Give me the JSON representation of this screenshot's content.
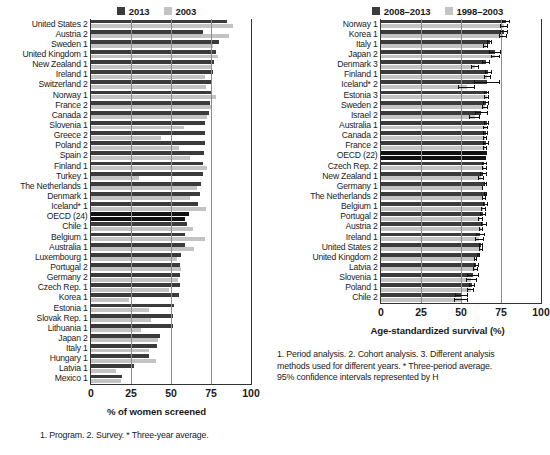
{
  "figure": {
    "panels": [
      {
        "id": "left",
        "legend": [
          {
            "label": "2013",
            "color": "#3b3b3b"
          },
          {
            "label": "2003",
            "color": "#c3c3c3"
          }
        ],
        "axis_title": "% of women screened",
        "ticks": [
          "0",
          "25",
          "50",
          "75",
          "100"
        ],
        "footnote": "1. Program. 2. Survey. * Three-year average."
      },
      {
        "id": "right",
        "legend": [
          {
            "label": "2008–2013",
            "color": "#3b3b3b"
          },
          {
            "label": "1998–2003",
            "color": "#c3c3c3"
          }
        ],
        "axis_title": "Age-standardized survival (%)",
        "ticks": [
          "0",
          "25",
          "50",
          "75",
          "100"
        ],
        "footnote": "1. Period analysis. 2. Cohort analysis. 3. Different analysis\nmethods used for different years. * Three-period average.\n95% confidence intervals represented by H"
      }
    ]
  },
  "chart_data": [
    {
      "type": "bar",
      "id": "cervical-screening",
      "title": "",
      "orientation": "horizontal",
      "xlabel": "% of women screened",
      "ylabel": "",
      "xlim": [
        0,
        100
      ],
      "xticks": [
        0,
        25,
        50,
        75,
        100
      ],
      "grid": true,
      "legend_position": "top",
      "categories": [
        "United States 2",
        "Austria 2",
        "Sweden 1",
        "United Kingdom 1",
        "New Zealand 1",
        "Ireland 1",
        "Switzerland 2",
        "Norway 1",
        "France 2",
        "Canada 2",
        "Slovenia 1",
        "Greece 2",
        "Poland 2",
        "Spain 2",
        "Finland 1",
        "Turkey 1",
        "The Netherlands 1",
        "Denmark 1",
        "Iceland* 1",
        "OECD (24)",
        "Chile 1",
        "Belgium 1",
        "Australia 1",
        "Luxembourg 1",
        "Portugal 2",
        "Germany 2",
        "Czech Rep. 1",
        "Korea 1",
        "Estonia 1",
        "Slovak Rep. 1",
        "Lithuania 1",
        "Japan 2",
        "Italy 1",
        "Hungary 1",
        "Latvia 1",
        "Mexico 1"
      ],
      "series": [
        {
          "name": "2013",
          "color": "#3b3b3b",
          "values": [
            85.0,
            70.0,
            80.0,
            78.0,
            77.0,
            76.0,
            75.0,
            75.0,
            74.5,
            74.0,
            71.5,
            71.0,
            71.0,
            70.5,
            70.0,
            70.0,
            68.5,
            68.0,
            67.0,
            61.5,
            60.0,
            59.0,
            58.5,
            56.0,
            55.5,
            55.5,
            55.5,
            55.0,
            52.0,
            51.5,
            51.0,
            43.0,
            41.0,
            36.0,
            27.0,
            19.5
          ]
        },
        {
          "name": "2003",
          "color": "#c3c3c3",
          "values": [
            88.5,
            86.0,
            76.0,
            79.5,
            75.5,
            71.5,
            72.0,
            78.0,
            75.5,
            72.5,
            58.0,
            44.0,
            55.0,
            62.0,
            72.5,
            30.0,
            66.0,
            62.0,
            72.0,
            59.0,
            63.5,
            71.0,
            64.5,
            54.0,
            56.5,
            54.5,
            49.0,
            23.5,
            36.5,
            37.5,
            31.0,
            42.0,
            36.5,
            40.5,
            15.5,
            19.0
          ]
        }
      ]
    },
    {
      "type": "bar",
      "id": "cervical-cancer-survival",
      "title": "",
      "orientation": "horizontal",
      "xlabel": "Age-standardized survival (%)",
      "ylabel": "",
      "xlim": [
        0,
        100
      ],
      "xticks": [
        0,
        25,
        50,
        75,
        100
      ],
      "grid": true,
      "legend_position": "top",
      "error_bars": "95% confidence intervals",
      "categories": [
        "Norway 1",
        "Korea 1",
        "Italy 1",
        "Japan 2",
        "Denmark 3",
        "Finland 1",
        "Iceland* 2",
        "Estonia 3",
        "Sweden 2",
        "Israel 2",
        "Australia 1",
        "Canada 2",
        "France 2",
        "OECD (22)",
        "Czech Rep. 2",
        "New Zealand 1",
        "Germany 1",
        "The Netherlands 2",
        "Belgium 1",
        "Portugal 2",
        "Austria 2",
        "Ireland 1",
        "United States 2",
        "United Kingdom 2",
        "Latvia 2",
        "Slovenia 1",
        "Poland 1",
        "Chile 2"
      ],
      "series": [
        {
          "name": "2008–2013",
          "color": "#3b3b3b",
          "values": [
            78.0,
            77.0,
            68.0,
            71.5,
            65.5,
            67.0,
            66.0,
            66.0,
            65.5,
            62.5,
            66.0,
            65.5,
            65.5,
            66.0,
            64.5,
            64.0,
            65.0,
            65.5,
            65.0,
            63.5,
            64.0,
            62.0,
            62.5,
            61.0,
            59.5,
            57.5,
            57.0,
            50.5
          ],
          "ci_low": [
            75.5,
            74.5,
            66.5,
            67.5,
            63.0,
            65.0,
            58.0,
            64.5,
            63.5,
            58.5,
            64.5,
            64.0,
            64.0,
            65.5,
            63.0,
            62.0,
            64.5,
            64.5,
            63.5,
            62.0,
            62.5,
            59.5,
            61.5,
            60.0,
            58.0,
            54.0,
            55.0,
            46.5
          ],
          "ci_high": [
            80.5,
            79.5,
            69.5,
            75.0,
            68.0,
            69.5,
            74.5,
            67.5,
            67.5,
            67.0,
            67.5,
            67.0,
            67.5,
            66.5,
            66.0,
            66.5,
            66.0,
            66.5,
            67.0,
            65.5,
            66.0,
            65.0,
            63.5,
            62.0,
            61.0,
            61.5,
            59.0,
            54.5
          ]
        },
        {
          "name": "1998–2003",
          "color": "#c3c3c3",
          "values": [
            77.0,
            76.0,
            65.5,
            71.5,
            59.0,
            66.5,
            53.5,
            66.0,
            65.0,
            58.5,
            65.5,
            65.0,
            65.0,
            65.0,
            64.5,
            62.5,
            63.5,
            64.0,
            64.0,
            62.0,
            62.5,
            61.5,
            62.5,
            59.0,
            59.0,
            56.5,
            56.0,
            50.0
          ],
          "ci_low": [
            74.5,
            73.5,
            64.0,
            68.5,
            56.5,
            64.5,
            48.0,
            64.5,
            63.0,
            55.0,
            64.0,
            63.5,
            63.5,
            64.5,
            63.0,
            60.5,
            63.0,
            63.0,
            62.5,
            60.5,
            61.0,
            58.5,
            61.5,
            58.0,
            57.5,
            53.0,
            54.0,
            45.5
          ],
          "ci_high": [
            79.5,
            78.5,
            67.0,
            74.5,
            61.5,
            68.5,
            59.0,
            67.5,
            67.0,
            62.0,
            67.0,
            66.5,
            66.5,
            65.5,
            66.0,
            64.5,
            64.0,
            65.5,
            65.5,
            63.5,
            64.0,
            64.5,
            63.5,
            60.0,
            60.5,
            60.0,
            58.0,
            54.5
          ]
        }
      ]
    }
  ]
}
